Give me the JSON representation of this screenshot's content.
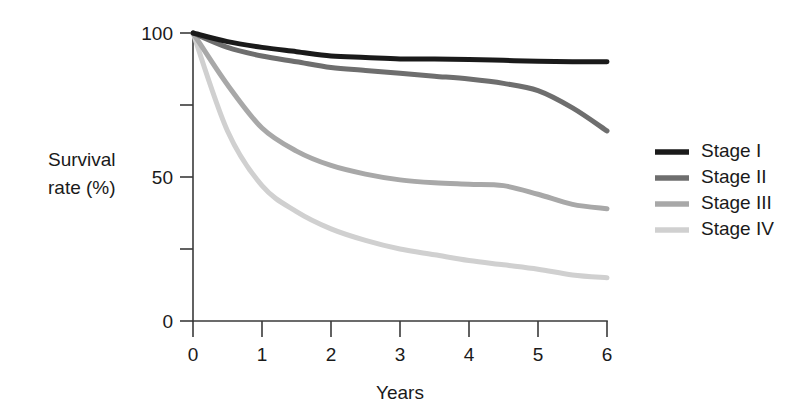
{
  "chart_data": {
    "type": "line",
    "title": "",
    "xlabel": "Years",
    "ylabel": "Survival rate (%)",
    "ylabel_line1": "Survival",
    "ylabel_line2": "rate (%)",
    "xlim": [
      0,
      6
    ],
    "ylim": [
      0,
      100
    ],
    "grid": false,
    "legend_position": "right",
    "x_ticks": [
      0,
      1,
      2,
      3,
      4,
      5,
      6
    ],
    "x_tick_labels": [
      "0",
      "1",
      "2",
      "3",
      "4",
      "5",
      "6"
    ],
    "y_ticks": [
      0,
      25,
      50,
      75,
      100
    ],
    "y_tick_labels": [
      "0",
      "",
      "50",
      "",
      "100"
    ],
    "x": [
      0,
      0.5,
      1,
      1.5,
      2,
      2.5,
      3,
      3.5,
      4,
      4.5,
      5,
      5.5,
      6
    ],
    "series": [
      {
        "name": "Stage I",
        "color": "#1a1a1a",
        "width": 5.0,
        "values": [
          100,
          97,
          95,
          93.5,
          92,
          91.5,
          91,
          91,
          90.8,
          90.5,
          90.2,
          90,
          90
        ]
      },
      {
        "name": "Stage II",
        "color": "#6e6e6e",
        "width": 5.0,
        "values": [
          100,
          95,
          92,
          90,
          88,
          87,
          86,
          85,
          84,
          82.5,
          80,
          74,
          66
        ]
      },
      {
        "name": "Stage III",
        "color": "#a8a8a8",
        "width": 5.0,
        "values": [
          100,
          82,
          67,
          59,
          54,
          51,
          49,
          48,
          47.5,
          47,
          44,
          40.5,
          39
        ]
      },
      {
        "name": "Stage IV",
        "color": "#d0d0d0",
        "width": 5.0,
        "values": [
          100,
          66,
          47,
          38,
          32,
          28,
          25,
          23,
          21,
          19.5,
          18,
          16,
          15
        ]
      }
    ]
  },
  "legend": {
    "entries": [
      {
        "label": "Stage I",
        "color": "#1a1a1a"
      },
      {
        "label": "Stage II",
        "color": "#6e6e6e"
      },
      {
        "label": "Stage III",
        "color": "#a8a8a8"
      },
      {
        "label": "Stage IV",
        "color": "#d0d0d0"
      }
    ]
  }
}
